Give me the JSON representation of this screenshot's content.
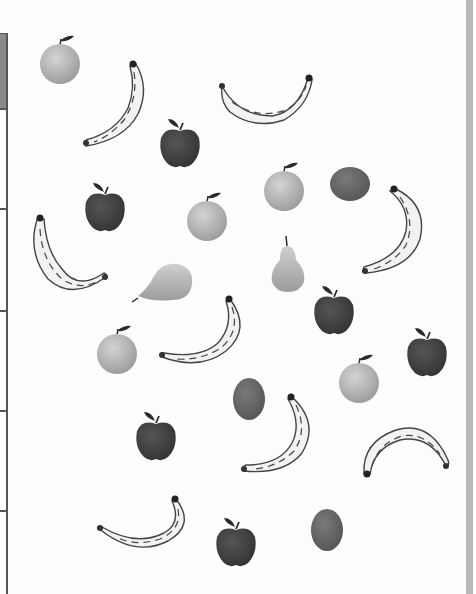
{
  "page": {
    "type": "fruit counting worksheet scan",
    "background": "#fdfdfd"
  },
  "table_edge": {
    "header_fill": "#8a8a8a",
    "line_color": "#555555",
    "row_lines_y": [
      108,
      208,
      310,
      410,
      510
    ]
  },
  "right_bar": {
    "color": "#b8b8b8"
  },
  "colors": {
    "apple": "#3e3e3e",
    "orange": "#bdbdbd",
    "kiwi": "#6a6a6a",
    "pear": "#b0b0b0",
    "banana_fill": "#f2f2f2",
    "banana_stroke": "#444444",
    "leaf": "#2a2a2a"
  },
  "fruits": [
    {
      "kind": "orange",
      "x": 38,
      "y": 33
    },
    {
      "kind": "banana",
      "x": 80,
      "y": 58,
      "rot": 0
    },
    {
      "kind": "banana",
      "x": 218,
      "y": 72,
      "rot": 1
    },
    {
      "kind": "apple",
      "x": 158,
      "y": 116
    },
    {
      "kind": "orange",
      "x": 262,
      "y": 160
    },
    {
      "kind": "kiwi",
      "x": 328,
      "y": 162
    },
    {
      "kind": "apple",
      "x": 83,
      "y": 180
    },
    {
      "kind": "orange",
      "x": 185,
      "y": 190
    },
    {
      "kind": "banana",
      "x": 360,
      "y": 185,
      "rot": 2
    },
    {
      "kind": "banana",
      "x": 30,
      "y": 215,
      "rot": 3
    },
    {
      "kind": "pear",
      "x": 268,
      "y": 234
    },
    {
      "kind": "pear-side",
      "x": 132,
      "y": 260
    },
    {
      "kind": "apple",
      "x": 312,
      "y": 283
    },
    {
      "kind": "banana",
      "x": 160,
      "y": 295,
      "rot": 4
    },
    {
      "kind": "orange",
      "x": 95,
      "y": 323
    },
    {
      "kind": "apple",
      "x": 405,
      "y": 325
    },
    {
      "kind": "orange",
      "x": 337,
      "y": 352
    },
    {
      "kind": "kiwi",
      "x": 231,
      "y": 376
    },
    {
      "kind": "apple",
      "x": 134,
      "y": 409
    },
    {
      "kind": "banana",
      "x": 240,
      "y": 393,
      "rot": 5
    },
    {
      "kind": "banana",
      "x": 360,
      "y": 420,
      "rot": 6
    },
    {
      "kind": "banana",
      "x": 96,
      "y": 495,
      "rot": 7
    },
    {
      "kind": "apple",
      "x": 214,
      "y": 515
    },
    {
      "kind": "kiwi",
      "x": 309,
      "y": 507
    }
  ]
}
